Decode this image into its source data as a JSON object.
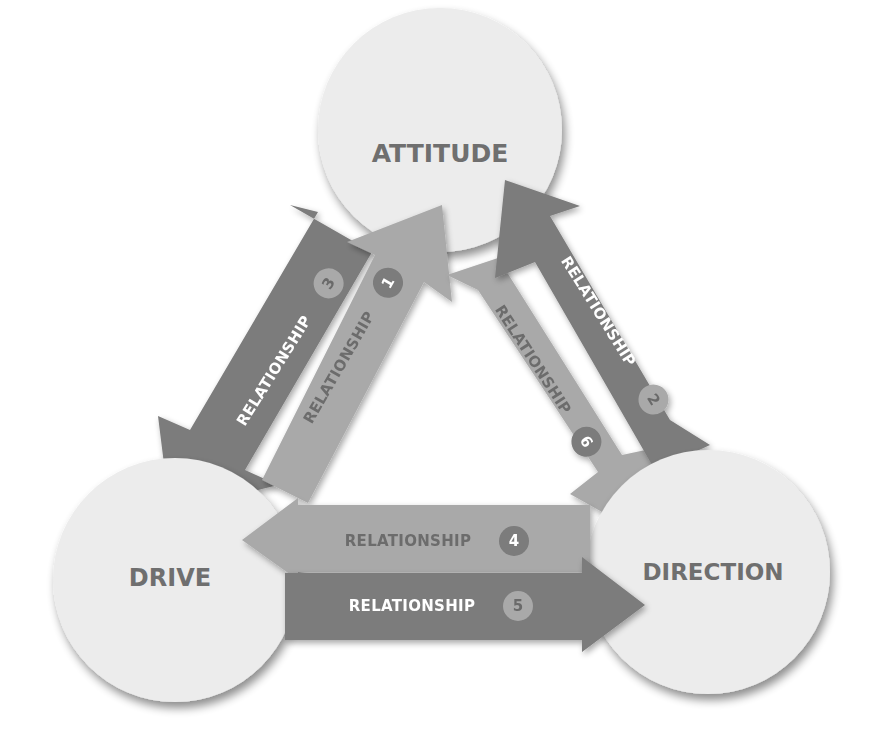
{
  "diagram": {
    "nodes": [
      {
        "id": "attitude",
        "label": "ATTITUDE"
      },
      {
        "id": "drive",
        "label": "DRIVE"
      },
      {
        "id": "direction",
        "label": "DIRECTION"
      }
    ],
    "relationships": [
      {
        "number": "1",
        "label": "RELATIONSHIP",
        "from": "drive",
        "to": "attitude"
      },
      {
        "number": "2",
        "label": "RELATIONSHIP",
        "from": "direction",
        "to": "attitude"
      },
      {
        "number": "3",
        "label": "RELATIONSHIP",
        "from": "attitude",
        "to": "drive"
      },
      {
        "number": "4",
        "label": "RELATIONSHIP",
        "from": "direction",
        "to": "drive"
      },
      {
        "number": "5",
        "label": "RELATIONSHIP",
        "from": "drive",
        "to": "direction"
      },
      {
        "number": "6",
        "label": "RELATIONSHIP",
        "from": "attitude",
        "to": "direction"
      }
    ],
    "colors": {
      "circle_fill": "#ececec",
      "node_text": "#6f6f6f",
      "arrow_dark": "#7b7b7b",
      "arrow_light": "#a9a9a9",
      "text_on_dark": "#ffffff",
      "text_on_light": "#707070",
      "badge_on_dark": "#a9a9a9",
      "badge_on_light": "#7b7b7b"
    }
  }
}
